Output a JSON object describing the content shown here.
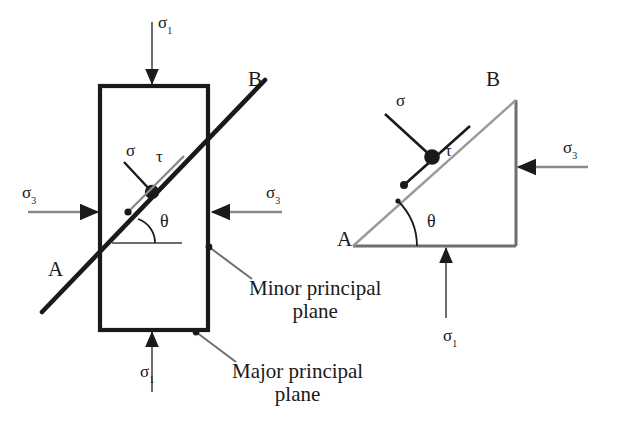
{
  "figure": {
    "colors": {
      "line_dark": "#1a1a1a",
      "line_gray": "#6e6e6e",
      "background": "#ffffff"
    },
    "labels": {
      "sigma": "σ",
      "tau": "τ",
      "theta": "θ",
      "sub_major": "1",
      "sub_minor": "3",
      "vertex_a": "A",
      "vertex_b": "B"
    },
    "captions": {
      "minor_line1": "Minor principal",
      "minor_line2": "plane",
      "major_line1": "Major principal",
      "major_line2": "plane"
    }
  },
  "left_diagram": {
    "name": "rectangular-element",
    "sigma1_top": "σ",
    "sigma1_top_sub": "1",
    "sigma1_bottom": "σ",
    "sigma1_bottom_sub": "1",
    "sigma3_left": "σ",
    "sigma3_left_sub": "3",
    "sigma3_right": "σ",
    "sigma3_right_sub": "3",
    "plane_label_a": "A",
    "plane_label_b": "B",
    "normal_stress": "σ",
    "shear_stress": "τ",
    "angle": "θ"
  },
  "right_diagram": {
    "name": "triangular-wedge",
    "sigma1_bottom": "σ",
    "sigma1_bottom_sub": "1",
    "sigma3_right": "σ",
    "sigma3_right_sub": "3",
    "vertex_a": "A",
    "vertex_b": "B",
    "normal_stress": "σ",
    "shear_stress": "τ",
    "angle": "θ"
  }
}
